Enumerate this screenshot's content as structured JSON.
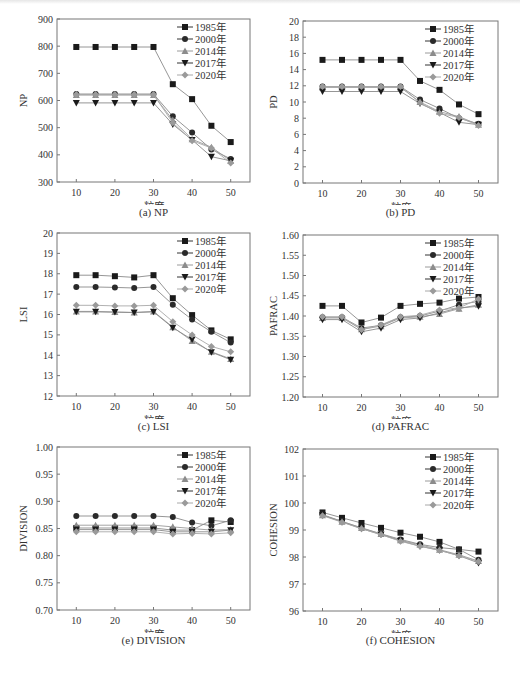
{
  "figure": {
    "x_label": "粒度",
    "legend": [
      "1985年",
      "2000年",
      "2014年",
      "2017年",
      "2020年"
    ],
    "series_styles": [
      {
        "name": "1985年",
        "marker": "square",
        "color": "#1a1a1a",
        "line": "#8a8a8a"
      },
      {
        "name": "2000年",
        "marker": "circle",
        "color": "#2a2a2a",
        "line": "#8a8a8a"
      },
      {
        "name": "2014年",
        "marker": "triangle-up",
        "color": "#8c8c8c",
        "line": "#9a9a9a"
      },
      {
        "name": "2017年",
        "marker": "triangle-down",
        "color": "#1a1a1a",
        "line": "#8a8a8a"
      },
      {
        "name": "2020年",
        "marker": "diamond",
        "color": "#9a9a9a",
        "line": "#a8a8a8"
      }
    ]
  },
  "panels": [
    {
      "caption": "(a)  NP"
    },
    {
      "caption": "(b)  PD"
    },
    {
      "caption": "(c)  LSI"
    },
    {
      "caption": "(d)  PAFRAC"
    },
    {
      "caption": "(e)  DIVISION"
    },
    {
      "caption": "(f)  COHESION"
    }
  ],
  "chart_data": [
    {
      "type": "line",
      "title": "(a) NP",
      "xlabel": "粒度",
      "ylabel": "NP",
      "x": [
        10,
        15,
        20,
        25,
        30,
        35,
        40,
        45,
        50
      ],
      "xticks": [
        10,
        20,
        30,
        40,
        50
      ],
      "ylim": [
        300,
        900
      ],
      "yticks": [
        300,
        400,
        500,
        600,
        700,
        800,
        900
      ],
      "ytick_labels": [
        "300",
        "400",
        "500",
        "600",
        "700",
        "800",
        "900"
      ],
      "legend_position": "upper right",
      "grid": false,
      "series": [
        {
          "name": "1985年",
          "values": [
            797,
            797,
            797,
            797,
            797,
            660,
            605,
            507,
            447
          ]
        },
        {
          "name": "2000年",
          "values": [
            624,
            624,
            624,
            624,
            624,
            542,
            482,
            420,
            385
          ]
        },
        {
          "name": "2014年",
          "values": [
            620,
            620,
            620,
            620,
            620,
            528,
            457,
            428,
            378
          ]
        },
        {
          "name": "2017年",
          "values": [
            591,
            591,
            591,
            591,
            591,
            512,
            455,
            393,
            378
          ]
        },
        {
          "name": "2020年",
          "values": [
            622,
            622,
            622,
            622,
            622,
            518,
            452,
            425,
            370
          ]
        }
      ]
    },
    {
      "type": "line",
      "title": "(b) PD",
      "xlabel": "粒度",
      "ylabel": "PD",
      "x": [
        10,
        15,
        20,
        25,
        30,
        35,
        40,
        45,
        50
      ],
      "xticks": [
        10,
        20,
        30,
        40,
        50
      ],
      "ylim": [
        0,
        20
      ],
      "yticks": [
        0,
        2,
        4,
        6,
        8,
        10,
        12,
        14,
        16,
        18,
        20
      ],
      "ytick_labels": [
        "0",
        "2",
        "4",
        "6",
        "8",
        "10",
        "12",
        "14",
        "16",
        "18",
        "20"
      ],
      "legend_position": "upper right",
      "grid": false,
      "series": [
        {
          "name": "1985年",
          "values": [
            15.2,
            15.2,
            15.2,
            15.2,
            15.2,
            12.6,
            11.5,
            9.7,
            8.5
          ]
        },
        {
          "name": "2000年",
          "values": [
            11.9,
            11.9,
            11.9,
            11.9,
            11.9,
            10.3,
            9.2,
            8.0,
            7.3
          ]
        },
        {
          "name": "2014年",
          "values": [
            11.8,
            11.8,
            11.8,
            11.8,
            11.8,
            10.0,
            8.8,
            8.2,
            7.2
          ]
        },
        {
          "name": "2017年",
          "values": [
            11.3,
            11.3,
            11.3,
            11.3,
            11.3,
            9.8,
            8.7,
            7.5,
            7.2
          ]
        },
        {
          "name": "2020年",
          "values": [
            11.9,
            11.9,
            11.9,
            11.9,
            11.9,
            9.9,
            8.6,
            8.1,
            7.1
          ]
        }
      ]
    },
    {
      "type": "line",
      "title": "(c) LSI",
      "xlabel": "粒度",
      "ylabel": "LSI",
      "x": [
        10,
        15,
        20,
        25,
        30,
        35,
        40,
        45,
        50
      ],
      "xticks": [
        10,
        20,
        30,
        40,
        50
      ],
      "ylim": [
        12,
        20
      ],
      "yticks": [
        12,
        13,
        14,
        15,
        16,
        17,
        18,
        19,
        20
      ],
      "ytick_labels": [
        "12",
        "13",
        "14",
        "15",
        "16",
        "17",
        "18",
        "19",
        "20"
      ],
      "legend_position": "upper right",
      "grid": false,
      "series": [
        {
          "name": "1985年",
          "values": [
            17.93,
            17.93,
            17.88,
            17.82,
            17.93,
            16.8,
            15.97,
            15.22,
            14.78
          ]
        },
        {
          "name": "2000年",
          "values": [
            17.35,
            17.35,
            17.33,
            17.3,
            17.35,
            16.48,
            15.75,
            15.15,
            14.62
          ]
        },
        {
          "name": "2014年",
          "values": [
            16.15,
            16.15,
            16.12,
            16.1,
            16.15,
            15.38,
            14.7,
            14.17,
            13.82
          ]
        },
        {
          "name": "2017年",
          "values": [
            16.13,
            16.13,
            16.12,
            16.1,
            16.13,
            15.35,
            14.77,
            14.15,
            13.78
          ]
        },
        {
          "name": "2020年",
          "values": [
            16.45,
            16.45,
            16.42,
            16.42,
            16.45,
            15.65,
            15.0,
            14.43,
            14.17
          ]
        }
      ]
    },
    {
      "type": "line",
      "title": "(d) PAFRAC",
      "xlabel": "粒度",
      "ylabel": "PAFRAC",
      "x": [
        10,
        15,
        20,
        25,
        30,
        35,
        40,
        45,
        50
      ],
      "xticks": [
        10,
        20,
        30,
        40,
        50
      ],
      "ylim": [
        1.2,
        1.6
      ],
      "yticks": [
        1.2,
        1.25,
        1.3,
        1.35,
        1.4,
        1.45,
        1.5,
        1.55,
        1.6
      ],
      "ytick_labels": [
        "1.20",
        "1.25",
        "1.30",
        "1.35",
        "1.40",
        "1.45",
        "1.50",
        "1.55",
        "1.60"
      ],
      "legend_position": "upper right",
      "grid": false,
      "series": [
        {
          "name": "1985年",
          "values": [
            1.425,
            1.425,
            1.384,
            1.396,
            1.425,
            1.43,
            1.433,
            1.443,
            1.447
          ]
        },
        {
          "name": "2000年",
          "values": [
            1.397,
            1.397,
            1.37,
            1.377,
            1.397,
            1.4,
            1.412,
            1.428,
            1.436
          ]
        },
        {
          "name": "2014年",
          "values": [
            1.395,
            1.395,
            1.367,
            1.375,
            1.395,
            1.398,
            1.405,
            1.418,
            1.428
          ]
        },
        {
          "name": "2017年",
          "values": [
            1.391,
            1.391,
            1.361,
            1.37,
            1.391,
            1.395,
            1.408,
            1.42,
            1.424
          ]
        },
        {
          "name": "2020年",
          "values": [
            1.398,
            1.398,
            1.366,
            1.378,
            1.398,
            1.402,
            1.415,
            1.42,
            1.442
          ]
        }
      ]
    },
    {
      "type": "line",
      "title": "(e) DIVISION",
      "xlabel": "粒度",
      "ylabel": "DIVISION",
      "x": [
        10,
        15,
        20,
        25,
        30,
        35,
        40,
        45,
        50
      ],
      "xticks": [
        10,
        20,
        30,
        40,
        50
      ],
      "ylim": [
        0.7,
        1.0
      ],
      "yticks": [
        0.7,
        0.75,
        0.8,
        0.85,
        0.9,
        0.95,
        1.0
      ],
      "ytick_labels": [
        "0.70",
        "0.75",
        "0.80",
        "0.85",
        "0.90",
        "0.95",
        "1.00"
      ],
      "legend_position": "upper right",
      "grid": false,
      "series": [
        {
          "name": "1985年",
          "values": [
            0.851,
            0.851,
            0.851,
            0.851,
            0.851,
            0.847,
            0.847,
            0.865,
            0.862
          ]
        },
        {
          "name": "2000年",
          "values": [
            0.873,
            0.873,
            0.873,
            0.873,
            0.873,
            0.871,
            0.861,
            0.855,
            0.865
          ]
        },
        {
          "name": "2014年",
          "values": [
            0.856,
            0.856,
            0.856,
            0.856,
            0.856,
            0.853,
            0.85,
            0.847,
            0.848
          ]
        },
        {
          "name": "2017年",
          "values": [
            0.848,
            0.848,
            0.848,
            0.848,
            0.848,
            0.844,
            0.844,
            0.844,
            0.847
          ]
        },
        {
          "name": "2020年",
          "values": [
            0.844,
            0.844,
            0.844,
            0.844,
            0.844,
            0.84,
            0.841,
            0.84,
            0.842
          ]
        }
      ]
    },
    {
      "type": "line",
      "title": "(f) COHESION",
      "xlabel": "粒度",
      "ylabel": "COHESION",
      "x": [
        10,
        15,
        20,
        25,
        30,
        35,
        40,
        45,
        50
      ],
      "xticks": [
        10,
        20,
        30,
        40,
        50
      ],
      "ylim": [
        96,
        102
      ],
      "yticks": [
        96,
        97,
        98,
        99,
        100,
        101,
        102
      ],
      "ytick_labels": [
        "96",
        "97",
        "98",
        "99",
        "100",
        "101",
        "102"
      ],
      "legend_position": "upper right",
      "grid": false,
      "series": [
        {
          "name": "1985年",
          "values": [
            99.65,
            99.45,
            99.26,
            99.08,
            98.9,
            98.75,
            98.56,
            98.28,
            98.2
          ]
        },
        {
          "name": "2000年",
          "values": [
            99.57,
            99.32,
            99.08,
            98.86,
            98.65,
            98.47,
            98.35,
            98.28,
            97.9
          ]
        },
        {
          "name": "2014年",
          "values": [
            99.55,
            99.31,
            99.07,
            98.85,
            98.62,
            98.45,
            98.27,
            98.08,
            97.85
          ]
        },
        {
          "name": "2017年",
          "values": [
            99.55,
            99.3,
            99.05,
            98.83,
            98.6,
            98.4,
            98.25,
            98.05,
            97.78
          ]
        },
        {
          "name": "2020年",
          "values": [
            99.53,
            99.29,
            99.05,
            98.83,
            98.58,
            98.4,
            98.25,
            98.05,
            97.83
          ]
        }
      ]
    }
  ]
}
